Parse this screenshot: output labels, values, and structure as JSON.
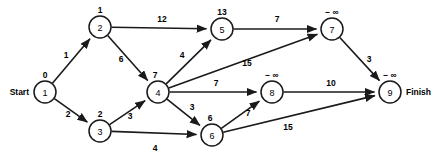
{
  "diagram": {
    "type": "directed-acyclic-graph",
    "title": "",
    "start_label": "Start",
    "finish_label": "Finish",
    "negative_infinity": "− ∞",
    "nodes": [
      {
        "id": "1",
        "value": "0",
        "x": 45,
        "y": 92,
        "r": 11,
        "value_dx": 0,
        "value_dy": -14,
        "terminal": "start"
      },
      {
        "id": "2",
        "value": "1",
        "x": 100,
        "y": 27,
        "r": 11,
        "value_dx": 0,
        "value_dy": -14,
        "terminal": ""
      },
      {
        "id": "3",
        "value": "2",
        "x": 100,
        "y": 131,
        "r": 11,
        "value_dx": 0,
        "value_dy": -14,
        "terminal": ""
      },
      {
        "id": "4",
        "value": "7",
        "x": 158,
        "y": 92,
        "r": 11,
        "value_dx": -3,
        "value_dy": -14,
        "terminal": ""
      },
      {
        "id": "5",
        "value": "13",
        "x": 222,
        "y": 29,
        "r": 11,
        "value_dx": 0,
        "value_dy": -14,
        "terminal": ""
      },
      {
        "id": "6",
        "value": "6",
        "x": 212,
        "y": 135,
        "r": 11,
        "value_dx": -2,
        "value_dy": -14,
        "terminal": ""
      },
      {
        "id": "7",
        "value": "− ∞",
        "x": 332,
        "y": 29,
        "r": 11,
        "value_dx": 0,
        "value_dy": -14,
        "terminal": ""
      },
      {
        "id": "8",
        "value": "− ∞",
        "x": 272,
        "y": 92,
        "r": 11,
        "value_dx": 0,
        "value_dy": -14,
        "terminal": ""
      },
      {
        "id": "9",
        "value": "− ∞",
        "x": 390,
        "y": 92,
        "r": 11,
        "value_dx": 0,
        "value_dy": -14,
        "terminal": "finish"
      }
    ],
    "edges": [
      {
        "from": "1",
        "to": "2",
        "weight": "1",
        "label_x": 66,
        "label_y": 58
      },
      {
        "from": "1",
        "to": "3",
        "weight": "2",
        "label_x": 68,
        "label_y": 117
      },
      {
        "from": "2",
        "to": "5",
        "weight": "12",
        "label_x": 162,
        "label_y": 22
      },
      {
        "from": "2",
        "to": "4",
        "weight": "6",
        "label_x": 121,
        "label_y": 62
      },
      {
        "from": "3",
        "to": "4",
        "weight": "3",
        "label_x": 130,
        "label_y": 119
      },
      {
        "from": "3",
        "to": "6",
        "weight": "4",
        "label_x": 155,
        "label_y": 151
      },
      {
        "from": "4",
        "to": "5",
        "weight": "4",
        "label_x": 182,
        "label_y": 58
      },
      {
        "from": "4",
        "to": "7",
        "weight": "15",
        "label_x": 247,
        "label_y": 66
      },
      {
        "from": "4",
        "to": "8",
        "weight": "7",
        "label_x": 216,
        "label_y": 86
      },
      {
        "from": "4",
        "to": "6",
        "weight": "3",
        "label_x": 192,
        "label_y": 110
      },
      {
        "from": "5",
        "to": "7",
        "weight": "7",
        "label_x": 277,
        "label_y": 22
      },
      {
        "from": "6",
        "to": "8",
        "weight": "7",
        "label_x": 248,
        "label_y": 116
      },
      {
        "from": "6",
        "to": "9",
        "weight": "15",
        "label_x": 288,
        "label_y": 130
      },
      {
        "from": "7",
        "to": "9",
        "weight": "3",
        "label_x": 369,
        "label_y": 62
      },
      {
        "from": "8",
        "to": "9",
        "weight": "10",
        "label_x": 331,
        "label_y": 86
      }
    ]
  }
}
